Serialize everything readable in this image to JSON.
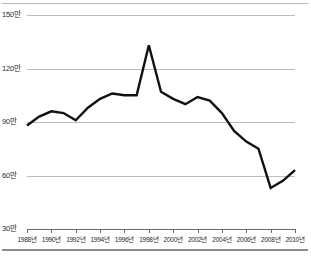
{
  "chart_data": {
    "type": "line",
    "title": "",
    "subtitle": "",
    "xlabel": "",
    "ylabel": "",
    "unit_suffix": "만",
    "year_suffix": "년",
    "grid": true,
    "grid_axis": "y",
    "legend": "none",
    "xlim": [
      1988,
      2010
    ],
    "ylim": [
      30,
      150
    ],
    "ytick_values": [
      150,
      120,
      90,
      60,
      30
    ],
    "ytick_labels": [
      "150만",
      "120만",
      "90만",
      "60만",
      "30만"
    ],
    "xtick_values": [
      1988,
      1990,
      1992,
      1994,
      1996,
      1998,
      2000,
      2002,
      2004,
      2006,
      2008,
      2010
    ],
    "xtick_labels": [
      "1988년",
      "1990년",
      "1992년",
      "1994년",
      "1996년",
      "1998년",
      "2000년",
      "2002년",
      "2004년",
      "2006년",
      "2008년",
      "2010년"
    ],
    "series": [
      {
        "name": "",
        "color": "#111111",
        "line_width": 2.4,
        "x": [
          1988,
          1989,
          1990,
          1991,
          1992,
          1993,
          1994,
          1995,
          1996,
          1997,
          1998,
          1999,
          2000,
          2001,
          2002,
          2003,
          2004,
          2005,
          2006,
          2007,
          2008,
          2009,
          2010
        ],
        "values": [
          88,
          93,
          96,
          95,
          91,
          98,
          103,
          106,
          105,
          105,
          133,
          107,
          103,
          100,
          104,
          102,
          95,
          85,
          79,
          75,
          53,
          57,
          63
        ]
      }
    ],
    "annotations": {
      "peak_year": 1998,
      "peak_value": 133,
      "min_year": 2008,
      "min_value": 53,
      "start_value": 88,
      "end_value": 63
    }
  },
  "footer": {
    "caption": ""
  }
}
